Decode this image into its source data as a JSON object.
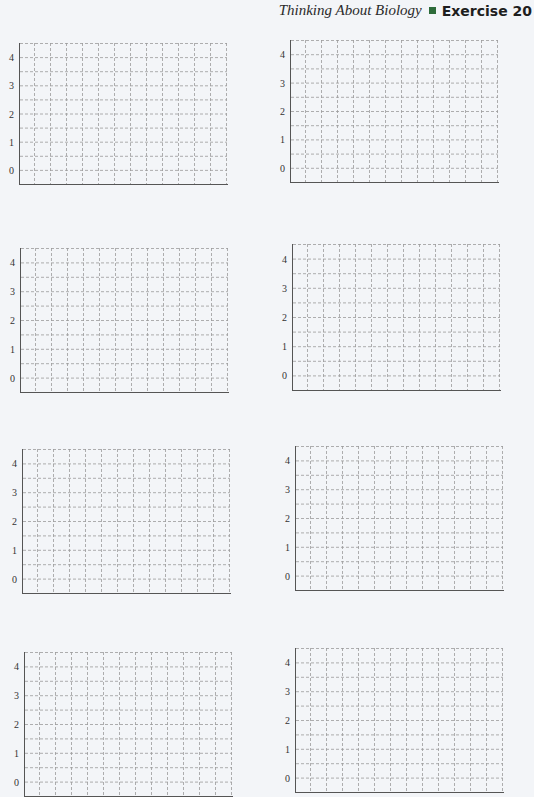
{
  "header": {
    "title": "Thinking About Biology",
    "exercise": "Exercise 20",
    "accent_color": "#2d6b3a"
  },
  "grid": {
    "y_ticks": [
      "4",
      "3",
      "2",
      "1",
      "0"
    ],
    "rows": 10,
    "columns": 13,
    "line_color": "#9a9a9a",
    "axis_color": "#555555"
  },
  "chart_data": [
    {
      "type": "blank_grid",
      "title": "",
      "xlabel": "",
      "ylabel": "",
      "ylim": [
        -0.5,
        4.5
      ],
      "yticks": [
        0,
        1,
        2,
        3,
        4
      ],
      "grid": true,
      "position": "row1-left"
    },
    {
      "type": "blank_grid",
      "title": "",
      "xlabel": "",
      "ylabel": "",
      "ylim": [
        -0.5,
        4.5
      ],
      "yticks": [
        0,
        1,
        2,
        3,
        4
      ],
      "grid": true,
      "position": "row1-right"
    },
    {
      "type": "blank_grid",
      "title": "",
      "xlabel": "",
      "ylabel": "",
      "ylim": [
        -0.5,
        4.5
      ],
      "yticks": [
        0,
        1,
        2,
        3,
        4
      ],
      "grid": true,
      "position": "row2-left"
    },
    {
      "type": "blank_grid",
      "title": "",
      "xlabel": "",
      "ylabel": "",
      "ylim": [
        -0.5,
        4.5
      ],
      "yticks": [
        0,
        1,
        2,
        3,
        4
      ],
      "grid": true,
      "position": "row2-right"
    },
    {
      "type": "blank_grid",
      "title": "",
      "xlabel": "",
      "ylabel": "",
      "ylim": [
        -0.5,
        4.5
      ],
      "yticks": [
        0,
        1,
        2,
        3,
        4
      ],
      "grid": true,
      "position": "row3-left"
    },
    {
      "type": "blank_grid",
      "title": "",
      "xlabel": "",
      "ylabel": "",
      "ylim": [
        -0.5,
        4.5
      ],
      "yticks": [
        0,
        1,
        2,
        3,
        4
      ],
      "grid": true,
      "position": "row3-right"
    },
    {
      "type": "blank_grid",
      "title": "",
      "xlabel": "",
      "ylabel": "",
      "ylim": [
        -0.5,
        4.5
      ],
      "yticks": [
        0,
        1,
        2,
        3,
        4
      ],
      "grid": true,
      "position": "row4-left"
    },
    {
      "type": "blank_grid",
      "title": "",
      "xlabel": "",
      "ylabel": "",
      "ylim": [
        -0.5,
        4.5
      ],
      "yticks": [
        0,
        1,
        2,
        3,
        4
      ],
      "grid": true,
      "position": "row4-right"
    }
  ],
  "graphs": [
    {
      "x": 19,
      "y": 43,
      "w": 208,
      "h": 141
    },
    {
      "x": 290,
      "y": 40,
      "w": 208,
      "h": 142
    },
    {
      "x": 20,
      "y": 248,
      "w": 208,
      "h": 144
    },
    {
      "x": 292,
      "y": 244,
      "w": 208,
      "h": 146
    },
    {
      "x": 22,
      "y": 449,
      "w": 208,
      "h": 144
    },
    {
      "x": 295,
      "y": 446,
      "w": 208,
      "h": 144
    },
    {
      "x": 24,
      "y": 652,
      "w": 208,
      "h": 144
    },
    {
      "x": 295,
      "y": 648,
      "w": 208,
      "h": 144
    }
  ]
}
